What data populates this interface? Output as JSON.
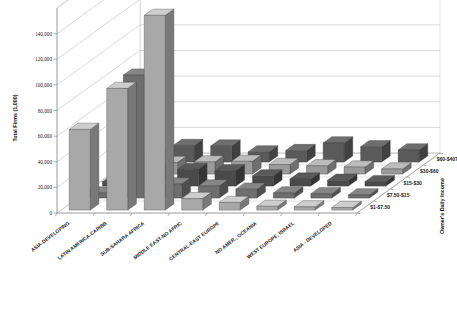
{
  "chart_data": {
    "type": "bar",
    "subtype": "3d-column",
    "title": "",
    "xlabel": "",
    "ylabel": "Total Firms (1,000)",
    "zlabel": "Owner's Daily Income",
    "categories": [
      "ASIA-DEVELOPING",
      "LATIN AMERICA-CARIBB",
      "SUB-SAHARA AFRICA",
      "MIDDLE EAST-NO AFRIC",
      "CENTRAL-EAST EUROPE",
      "NO AMER., OCEANIA",
      "WEST EUROPE, ISRAEL",
      "ASIA - DEVELOPED"
    ],
    "depth_categories": [
      "$1-$7.50",
      "$7.50-$15",
      "$15-$30",
      "$30-$60",
      "$60-$407"
    ],
    "yticks": [
      0,
      20000,
      40000,
      60000,
      80000,
      100000,
      120000,
      140000
    ],
    "ytick_labels": [
      "0",
      "20,000",
      "40,000",
      "60,000",
      "80,000",
      "100,000",
      "120,000",
      "140,000"
    ],
    "ylim": [
      0,
      160000
    ],
    "grid": true,
    "legend": "none",
    "series": [
      {
        "name": "$1-$7.50",
        "color": "#a8a8a8",
        "values": [
          63000,
          95000,
          152000,
          9000,
          6000,
          3000,
          2500,
          2000
        ]
      },
      {
        "name": "$7.50-$15",
        "color": "#6e6e6e",
        "values": [
          4000,
          96000,
          11000,
          9500,
          7000,
          4000,
          3500,
          2500
        ]
      },
      {
        "name": "$15-$30",
        "color": "#4a4a4a",
        "values": [
          3500,
          14000,
          13000,
          12000,
          8000,
          5500,
          4500,
          3500
        ]
      },
      {
        "name": "$30-$60",
        "color": "#9a9a9a",
        "values": [
          3000,
          9000,
          9500,
          10000,
          7500,
          6500,
          5500,
          4000
        ]
      },
      {
        "name": "$60-$407",
        "color": "#5a5a5a",
        "values": [
          4500,
          13000,
          12500,
          8000,
          9000,
          15000,
          12000,
          9500
        ]
      }
    ]
  },
  "axes": {
    "y_title": "Total Firms (1,000)",
    "z_title": "Owner's Daily Income"
  }
}
